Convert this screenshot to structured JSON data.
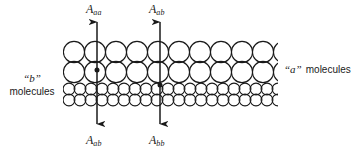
{
  "figure": {
    "name": "molecular-interface-adhesion-diagram",
    "background_color": "#ffffff",
    "ink_color": "#1a1a1a",
    "width": 355,
    "height": 155
  },
  "labels": {
    "arrow_left_top": {
      "symbol": "A",
      "subscript": "aa"
    },
    "arrow_left_bottom": {
      "symbol": "A",
      "subscript": "ab"
    },
    "arrow_right_top": {
      "symbol": "A",
      "subscript": "ab"
    },
    "arrow_right_bottom": {
      "symbol": "A",
      "subscript": "bb"
    },
    "left_phase": {
      "quoted": "“b”",
      "word": "molecules"
    },
    "right_phase": {
      "quoted": "“a”",
      "word": "molecules"
    }
  },
  "arrows": [
    {
      "id": "arrow-left",
      "x": 97,
      "top_y": 22,
      "bottom_y": 124,
      "dot_y": 70,
      "top_label": "A_aa",
      "bottom_label": "A_ab"
    },
    {
      "id": "arrow-right",
      "x": 160,
      "top_y": 22,
      "bottom_y": 124,
      "dot_y": 85,
      "top_label": "A_ab",
      "bottom_label": "A_bb"
    }
  ],
  "lattice": {
    "left": 63,
    "right": 278,
    "large_circle_diameter": 22,
    "small_circle_diameter": 12,
    "large_rows": 2,
    "small_rows": 2,
    "large_row_y_centers": [
      52,
      71
    ],
    "small_row_y_centers": [
      90,
      101
    ],
    "phase_a_region": "upper",
    "phase_b_region": "lower"
  }
}
